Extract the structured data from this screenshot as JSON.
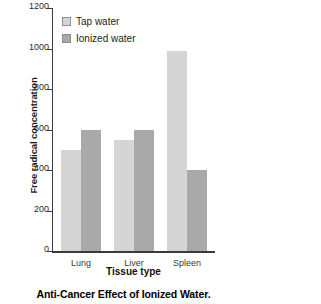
{
  "chart_data": {
    "type": "bar",
    "title": "",
    "xlabel": "Tissue type",
    "ylabel": "Free radical concentration",
    "categories": [
      "Lung",
      "Liver",
      "Spleen"
    ],
    "series": [
      {
        "name": "Tap water",
        "values": [
          500,
          550,
          990
        ],
        "color": "#d5d5d5"
      },
      {
        "name": "Ionized water",
        "values": [
          600,
          600,
          400
        ],
        "color": "#a9a9a9"
      }
    ],
    "ylim": [
      0,
      1200
    ],
    "yticks": [
      0,
      200,
      400,
      600,
      800,
      1000,
      1200
    ],
    "ytick_labels": [
      "0",
      "200",
      "400",
      "600",
      "800",
      "1000",
      "1200"
    ],
    "grid": false,
    "legend_position": "top-left"
  },
  "legend": {
    "items": [
      {
        "label": "Tap water",
        "swatch": "tap"
      },
      {
        "label": "Ionized water",
        "swatch": "ion"
      }
    ]
  },
  "caption": {
    "text": "Anti-Cancer Effect of Ionized Water."
  }
}
